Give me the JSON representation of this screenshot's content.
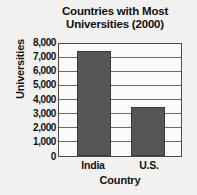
{
  "chart_data": {
    "type": "bar",
    "title": "Countries with Most Universities (2000)",
    "title_line1": "Countries with Most",
    "title_line2": "Universities (2000)",
    "xlabel": "Country",
    "ylabel": "Universities",
    "categories": [
      "India",
      "U.S."
    ],
    "values": [
      7500,
      3500
    ],
    "ylim": [
      0,
      8000
    ],
    "ytick_labels": [
      "8,000",
      "7,000",
      "6,000",
      "5,000",
      "4,000",
      "3,000",
      "2,000",
      "1,000",
      "0"
    ],
    "ytick_values": [
      8000,
      7000,
      6000,
      5000,
      4000,
      3000,
      2000,
      1000,
      0
    ],
    "grid": true,
    "legend": "none",
    "bar_color": "#575556",
    "background_color": "#f2f1ef",
    "plot_background_color": "#fbfafa",
    "axis_color": "#4c4a49"
  }
}
